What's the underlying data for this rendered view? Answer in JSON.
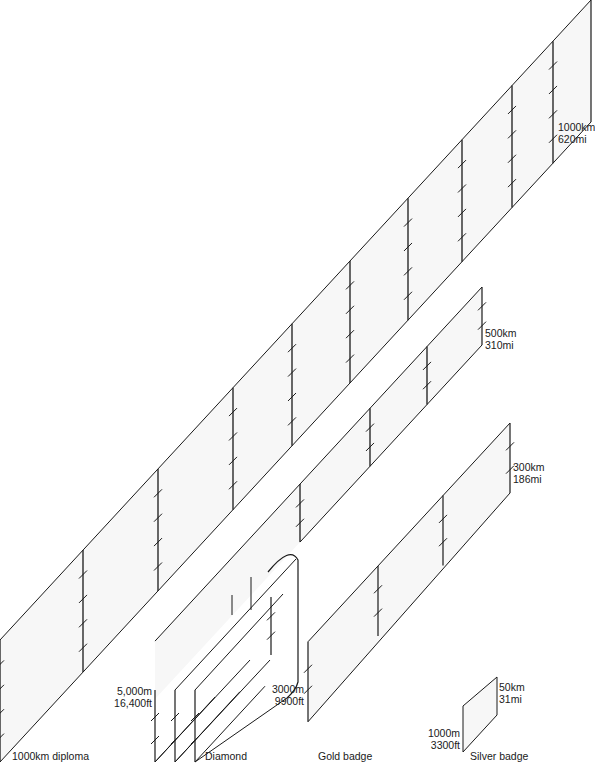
{
  "colors": {
    "line": "#1a1a1a",
    "fill": "#f7f7f7",
    "background": "#ffffff"
  },
  "ribbons": [
    {
      "id": "diploma-1000km",
      "label": "1000km diploma",
      "distance_km": "1000km",
      "distance_mi": "620mi",
      "top_left": [
        0,
        640
      ],
      "top_right": [
        591,
        0
      ],
      "bottom_left": [
        0,
        762
      ],
      "bottom_right": [
        591,
        118
      ],
      "dividers_x": [
        83,
        158,
        233,
        292,
        350,
        408,
        462,
        512,
        553
      ],
      "ticks_per_divider": 4
    },
    {
      "id": "diamond-500km",
      "label": "Diamond",
      "distance_km": "500km",
      "distance_mi": "310mi",
      "height_m": "5,000m",
      "height_ft": "16,400ft"
    },
    {
      "id": "gold-300km",
      "label": "Gold badge",
      "distance_km": "300km",
      "distance_mi": "186mi",
      "height_m": "3000m",
      "height_ft": "9900ft"
    },
    {
      "id": "silver-50km",
      "label": "Silver badge",
      "distance_km": "50km",
      "distance_mi": "31mi",
      "height_m": "1000m",
      "height_ft": "3300ft"
    }
  ],
  "labels": {
    "diploma_km": "1000km",
    "diploma_mi": "620mi",
    "diploma_name": "1000km diploma",
    "diamond_km": "500km",
    "diamond_mi": "310mi",
    "diamond_height_m": "5,000m",
    "diamond_height_ft": "16,400ft",
    "diamond_name": "Diamond",
    "gold_km": "300km",
    "gold_mi": "186mi",
    "gold_height_m": "3000m",
    "gold_height_ft": "9900ft",
    "gold_name": "Gold badge",
    "silver_km": "50km",
    "silver_mi": "31mi",
    "silver_height_m": "1000m",
    "silver_height_ft": "3300ft",
    "silver_name": "Silver badge"
  }
}
